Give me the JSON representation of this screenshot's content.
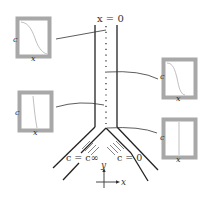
{
  "diagram": {
    "type": "microfluidic Y-junction (T-sensor) schematic",
    "colors": {
      "wall": "#222222",
      "inset_frame": "#a8a8a8",
      "inset_curve": "#b8b8b8",
      "leader": "#333333",
      "text": "#333333"
    },
    "labels": {
      "origin": "x = 0",
      "inlet_left": "c = c∞",
      "inlet_right": "c = 0",
      "axis_y": "y",
      "axis_x": "x"
    },
    "insets": [
      {
        "id": "top-left",
        "ylabel": "c",
        "xlabel": "x",
        "profile": "smooth sigmoid, high→low"
      },
      {
        "id": "middle-left",
        "ylabel": "c",
        "xlabel": "x",
        "profile": "near step, slight slope"
      },
      {
        "id": "top-right",
        "ylabel": "c",
        "xlabel": "x",
        "profile": "steep sigmoid, high→low"
      },
      {
        "id": "bottom-right",
        "ylabel": "c",
        "xlabel": "x",
        "profile": "sharp vertical step"
      }
    ]
  }
}
